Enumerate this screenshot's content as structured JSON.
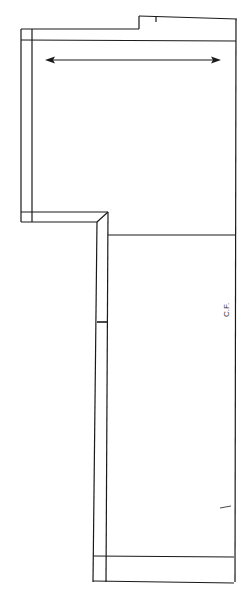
{
  "diagram": {
    "type": "sewing-pattern-piece",
    "labels": {
      "center_front": "C.F."
    },
    "markings": {
      "grainline": "double-headed-arrow-horizontal",
      "notches": [
        "top-edge-notch",
        "left-side-notch",
        "right-side-notch"
      ]
    },
    "colors": {
      "line": "#1a1a1a",
      "background": "#ffffff"
    }
  }
}
